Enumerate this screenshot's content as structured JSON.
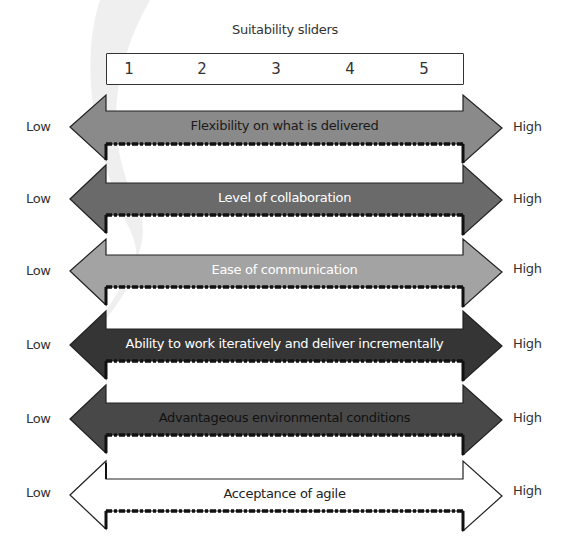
{
  "title": "Suitability sliders",
  "scale": {
    "values": [
      "1",
      "2",
      "3",
      "4",
      "5"
    ],
    "positions_x": [
      128,
      201,
      275,
      349,
      423
    ]
  },
  "labels": {
    "low": "Low",
    "high": "High"
  },
  "sliders": [
    {
      "label": "Flexibility on what is delivered",
      "fill": "#8a8a8a",
      "text_color": "#1a1a1a",
      "tip_y": 127
    },
    {
      "label": "Level of collaboration",
      "fill": "#6a6a6a",
      "text_color": "#ffffff",
      "tip_y": 199
    },
    {
      "label": "Ease of communication",
      "fill": "#a3a3a3",
      "text_color": "#ffffff",
      "tip_y": 271
    },
    {
      "label": "Ability to work iteratively and deliver incrementally",
      "fill": "#353535",
      "text_color": "#ffffff",
      "tip_y": 345
    },
    {
      "label": "Advantageous environmental conditions",
      "fill": "#484848",
      "text_color": "#111111",
      "tip_y": 419
    },
    {
      "label": "Acceptance of agile",
      "fill": "#ffffff",
      "text_color": "#222222",
      "tip_y": 493
    }
  ]
}
